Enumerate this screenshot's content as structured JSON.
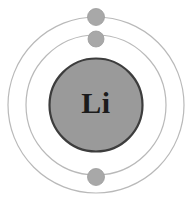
{
  "diagram": {
    "kind": "bohr-atomic-model",
    "element_symbol": "Li",
    "element_name": "Lithium",
    "atomic_number": 3,
    "background_color": "#ffffff",
    "canvas": {
      "width": 194,
      "height": 208
    },
    "center": {
      "x": 96,
      "y": 105
    },
    "nucleus": {
      "label": "Li",
      "cx": 96,
      "cy": 105,
      "r": 46.5,
      "fill_color": "#9a9a9a",
      "stroke_color": "#3d3d3d",
      "stroke_width": 2.2,
      "label_color": "#1b1b1b",
      "label_font_size": 30,
      "label_x": 96,
      "label_y": 106
    },
    "shells": [
      {
        "name": "inner-shell",
        "index": 1,
        "label": "K shell",
        "cx": 96,
        "cy": 105,
        "r": 70,
        "stroke_color": "#b9b9b9",
        "stroke_width": 1.2,
        "electron_count": 2
      },
      {
        "name": "outer-shell",
        "index": 2,
        "label": "L shell",
        "cx": 96,
        "cy": 105,
        "r": 88,
        "stroke_color": "#b9b9b9",
        "stroke_width": 1.2,
        "electron_count": 1
      }
    ],
    "electrons": [
      {
        "name": "electron-outer-top",
        "shell": "outer-shell",
        "cx": 96,
        "cy": 17,
        "r": 8.5,
        "fill_color": "#a8a8a8",
        "stroke_color": "#9c9c9c",
        "stroke_width": 0.8
      },
      {
        "name": "electron-inner-top",
        "shell": "inner-shell",
        "cx": 96,
        "cy": 39,
        "r": 8,
        "fill_color": "#a8a8a8",
        "stroke_color": "#9c9c9c",
        "stroke_width": 0.8
      },
      {
        "name": "electron-inner-bottom",
        "shell": "inner-shell",
        "cx": 96,
        "cy": 177,
        "r": 8.5,
        "fill_color": "#a8a8a8",
        "stroke_color": "#9c9c9c",
        "stroke_width": 0.8
      }
    ]
  }
}
